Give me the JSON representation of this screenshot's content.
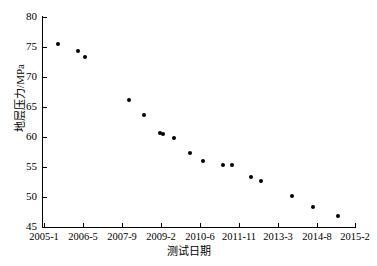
{
  "chart_data": {
    "type": "scatter",
    "title": "",
    "xlabel": "测试日期",
    "ylabel": "地层压力/MPa",
    "ylim": [
      45,
      80
    ],
    "ytick_values": [
      45,
      50,
      55,
      60,
      65,
      70,
      75,
      80
    ],
    "ytick_labels": [
      "45",
      "50",
      "55",
      "60",
      "65",
      "70",
      "75",
      "80"
    ],
    "xtick_labels": [
      "2005-1",
      "2006-5",
      "2007-9",
      "2009-2",
      "2010-6",
      "2011-11",
      "2013-3",
      "2014-8",
      "2015-2"
    ],
    "xtick_positions": [
      44,
      83,
      122,
      161,
      200,
      239,
      278,
      317,
      355
    ],
    "grid": false,
    "legend": null,
    "series": [
      {
        "name": "地层压力",
        "marker": "filled-circle",
        "color": "#000000",
        "points": [
          {
            "x_px": 58,
            "y_px": 44,
            "date": "2005-7",
            "value": 75.5
          },
          {
            "x_px": 78,
            "y_px": 51,
            "date": "2006-3",
            "value": 74.3
          },
          {
            "x_px": 85,
            "y_px": 57,
            "date": "2006-6",
            "value": 73.3
          },
          {
            "x_px": 129,
            "y_px": 100,
            "date": "2008-2",
            "value": 66.2
          },
          {
            "x_px": 144,
            "y_px": 115,
            "date": "2008-9",
            "value": 63.7
          },
          {
            "x_px": 160,
            "y_px": 133,
            "date": "2009-5",
            "value": 60.7
          },
          {
            "x_px": 163,
            "y_px": 134,
            "date": "2009-6",
            "value": 60.5
          },
          {
            "x_px": 174,
            "y_px": 138,
            "date": "2009-11",
            "value": 59.8
          },
          {
            "x_px": 190,
            "y_px": 153,
            "date": "2010-6",
            "value": 57.3
          },
          {
            "x_px": 203,
            "y_px": 161,
            "date": "2010-11",
            "value": 56.0
          },
          {
            "x_px": 223,
            "y_px": 165,
            "date": "2011-8",
            "value": 55.3
          },
          {
            "x_px": 232,
            "y_px": 165,
            "date": "2011-12",
            "value": 55.3
          },
          {
            "x_px": 251,
            "y_px": 177,
            "date": "2012-8",
            "value": 53.3
          },
          {
            "x_px": 261,
            "y_px": 181,
            "date": "2012-12",
            "value": 52.7
          },
          {
            "x_px": 292,
            "y_px": 196,
            "date": "2014-1",
            "value": 50.2
          },
          {
            "x_px": 313,
            "y_px": 207,
            "date": "2014-9",
            "value": 48.3
          },
          {
            "x_px": 338,
            "y_px": 216,
            "date": "2015-7",
            "value": 46.8
          }
        ]
      }
    ]
  },
  "axes": {
    "y_label_text": "地层压力/MPa",
    "x_label_text": "测试日期"
  }
}
